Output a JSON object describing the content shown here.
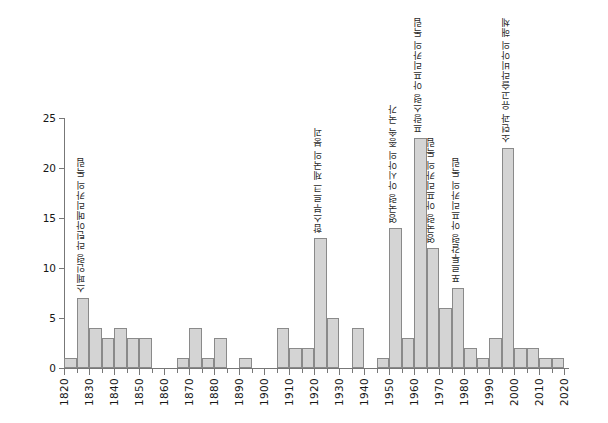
{
  "chart_data": {
    "type": "bar",
    "title": "",
    "subtitle": "",
    "xlabel": "",
    "ylabel": "",
    "xlim": [
      1820,
      2022
    ],
    "ylim": [
      0,
      25
    ],
    "grid": false,
    "legend": null,
    "bar_fill_color": "#d4d4d4",
    "bar_edge_color": "#8a8a8a",
    "axis_color": "#777777",
    "bin_width_years": 5,
    "y_ticks": [
      0,
      5,
      10,
      15,
      20,
      25
    ],
    "y_tick_labels": [
      "0",
      "5",
      "10",
      "15",
      "20",
      "25"
    ],
    "x_tick_labels": [
      "1820",
      "1830",
      "1840",
      "1850",
      "1860",
      "1870",
      "1880",
      "1890",
      "1900",
      "1910",
      "1920",
      "1930",
      "1940",
      "1950",
      "1960",
      "1970",
      "1980",
      "1990",
      "2000",
      "2010",
      "2020"
    ],
    "x_minor_ticks": [
      1825,
      1835,
      1845,
      1855,
      1865,
      1875,
      1885,
      1895,
      1905,
      1915,
      1925,
      1935,
      1945,
      1955,
      1965,
      1975,
      1985,
      1995,
      2005,
      2015
    ],
    "categories": [
      1820,
      1825,
      1830,
      1835,
      1840,
      1845,
      1850,
      1855,
      1860,
      1865,
      1870,
      1875,
      1880,
      1885,
      1890,
      1895,
      1900,
      1905,
      1910,
      1915,
      1920,
      1925,
      1930,
      1935,
      1940,
      1945,
      1950,
      1955,
      1960,
      1965,
      1970,
      1975,
      1980,
      1985,
      1990,
      1995,
      2000,
      2005,
      2010,
      2015
    ],
    "values": [
      1,
      7,
      4,
      3,
      4,
      3,
      3,
      0,
      0,
      1,
      4,
      1,
      3,
      0,
      1,
      0,
      0,
      4,
      2,
      2,
      13,
      5,
      0,
      4,
      0,
      1,
      14,
      3,
      23,
      12,
      6,
      8,
      2,
      1,
      3,
      22,
      2,
      2,
      1,
      1
    ],
    "annotations": [
      {
        "text": "스페인령 라틴아메리카의 독립",
        "at_bin": 1825,
        "value": 7
      },
      {
        "text": "합스부르크 제국의 붕괴",
        "at_bin": 1920,
        "value": 13
      },
      {
        "text": "영국령 아시아의 종속 국가",
        "at_bin": 1950,
        "value": 14
      },
      {
        "text": "프랑스령 아프리카의 독립",
        "at_bin": 1960,
        "value": 23
      },
      {
        "text": "영국령 아프리카의 독립",
        "at_bin": 1965,
        "value": 12
      },
      {
        "text": "포르투갈령 아프리카의 독립",
        "at_bin": 1975,
        "value": 8
      },
      {
        "text": "소련과 유고슬라비아의 해체",
        "at_bin": 1995,
        "value": 22
      }
    ]
  }
}
